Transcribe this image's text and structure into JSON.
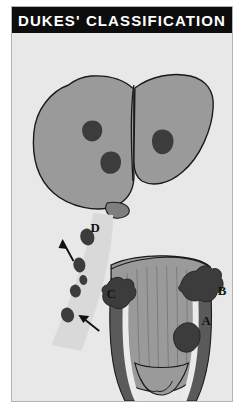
{
  "title": "DUKES' CLASSIFICATION",
  "figure": {
    "caption": "Dukes' classification of colorectal carcinoma spread",
    "background_color": "#e8e8e8",
    "border_color": "#b4b4b4",
    "title_bar_color": "#0d0d0d",
    "title_text_color": "#ffffff"
  },
  "palette": {
    "organ_gray": "#9a9a9a",
    "organ_gray_light": "#a8a8a8",
    "organ_gray_dark": "#808080",
    "tumor_dark": "#3c3c3c",
    "muscle_dark": "#5a5a5a",
    "lumen_light": "#c8c8c8",
    "mesentery_pale": "#d2d2d2",
    "outline": "#1a1a1a",
    "label_color": "#111111"
  },
  "labels": [
    {
      "id": "A",
      "text": "A",
      "x": 196,
      "y": 311,
      "stage": "Tumour confined to bowel wall"
    },
    {
      "id": "B",
      "text": "B",
      "x": 212,
      "y": 288,
      "stage": "Tumour through bowel wall"
    },
    {
      "id": "C",
      "text": "C",
      "x": 100,
      "y": 265,
      "stage": "Regional lymph node involvement"
    },
    {
      "id": "D",
      "text": "D",
      "x": 84,
      "y": 199,
      "stage": "Distant metastases (liver)"
    }
  ],
  "arrows": [
    {
      "id": "arrow-to-node-d",
      "points": "from 62,228 to 50,206",
      "target": "lymph-node-upper"
    },
    {
      "id": "arrow-to-node-c",
      "points": "from 86,296 to 66,279",
      "target": "lymph-node-lower"
    }
  ],
  "anatomy": {
    "liver": {
      "name": "liver",
      "lobes": [
        "left-lobe",
        "right-lobe"
      ],
      "metastases_count": 3,
      "metastasis_positions": [
        {
          "cx": 81,
          "cy": 98
        },
        {
          "cx": 101,
          "cy": 128
        },
        {
          "cx": 153,
          "cy": 108
        }
      ],
      "gallbladder": {
        "cx": 107,
        "cy": 177
      }
    },
    "lymph_nodes": {
      "name": "mesenteric-lymph-node-chain",
      "count": 5,
      "positions": [
        {
          "cx": 76,
          "cy": 204
        },
        {
          "cx": 68,
          "cy": 232
        },
        {
          "cx": 66,
          "cy": 262
        },
        {
          "cx": 57,
          "cy": 281
        },
        {
          "cx": 71,
          "cy": 250
        }
      ]
    },
    "rectum": {
      "name": "rectum-and-anal-canal",
      "features": [
        "mucosal-folds",
        "muscular-wall",
        "anal-canal",
        "sphincter-columns"
      ],
      "tumours": [
        {
          "id": "tumour-a",
          "label": "A",
          "description": "intramural tumour confined to wall",
          "cx": 175,
          "cy": 308
        },
        {
          "id": "tumour-b",
          "label": "B",
          "description": "tumour penetrating through wall",
          "cx": 185,
          "cy": 272
        },
        {
          "id": "tumour-left",
          "label": "",
          "description": "tumour on left bowel rim",
          "cx": 112,
          "cy": 277
        }
      ]
    }
  }
}
